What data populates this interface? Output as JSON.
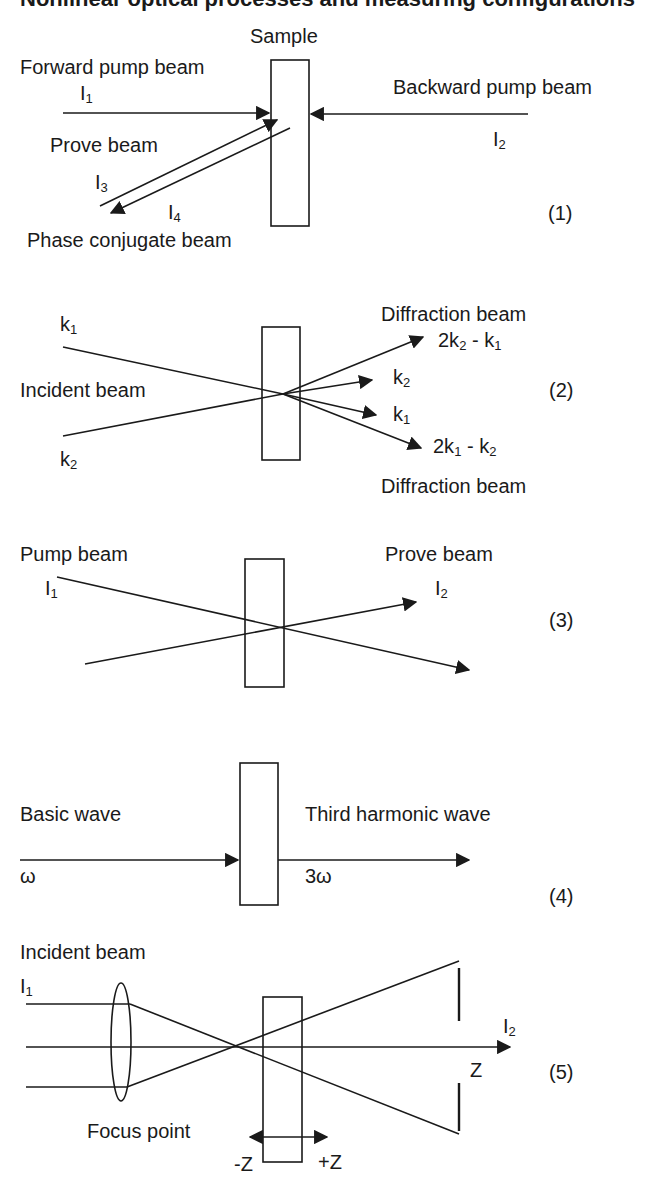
{
  "title_cut": "Nonlinear optical processes and measuring configurations",
  "diagrams": [
    {
      "id": "1",
      "number": "(1)",
      "sample_label": "Sample",
      "forward_pump": "Forward pump beam",
      "forward_intensity": "I",
      "forward_intensity_sub": "1",
      "backward_pump": "Backward pump beam",
      "backward_intensity": "I",
      "backward_intensity_sub": "2",
      "prove": "Prove beam",
      "prove_intensity": "I",
      "prove_intensity_sub": "3",
      "conjugate_intensity": "I",
      "conjugate_intensity_sub": "4",
      "conjugate": "Phase conjugate beam"
    },
    {
      "id": "2",
      "number": "(2)",
      "k1": "k",
      "k1_sub": "1",
      "k2": "k",
      "k2_sub": "2",
      "incident": "Incident beam",
      "diffraction_top": "Diffraction beam",
      "diffraction_bottom": "Diffraction beam",
      "out_top_a": "2k",
      "out_top_a_sub": "2",
      "out_top_b": " - k",
      "out_top_b_sub": "1",
      "out_k2": "k",
      "out_k2_sub": "2",
      "out_k1": "k",
      "out_k1_sub": "1",
      "out_bottom_a": "2k",
      "out_bottom_a_sub": "1",
      "out_bottom_b": " - k",
      "out_bottom_b_sub": "2"
    },
    {
      "id": "3",
      "number": "(3)",
      "pump": "Pump beam",
      "pump_intensity": "I",
      "pump_intensity_sub": "1",
      "prove": "Prove beam",
      "prove_intensity": "I",
      "prove_intensity_sub": "2"
    },
    {
      "id": "4",
      "number": "(4)",
      "basic": "Basic wave",
      "basic_freq": "ω",
      "third": "Third harmonic wave",
      "third_freq": "3ω"
    },
    {
      "id": "5",
      "number": "(5)",
      "incident": "Incident beam",
      "in_intensity": "I",
      "in_intensity_sub": "1",
      "out_intensity": "I",
      "out_intensity_sub": "2",
      "axis": "Z",
      "focus": "Focus point",
      "minus_z": "-Z",
      "plus_z": "+Z"
    }
  ],
  "colors": {
    "ink": "#1a1a1a",
    "background": "#ffffff"
  }
}
